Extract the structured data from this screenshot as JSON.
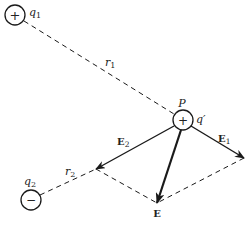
{
  "diagram": {
    "charges": [
      {
        "id": "q1",
        "label": "q",
        "subscript": "1",
        "sign": "+",
        "cx": 15,
        "cy": 15,
        "r": 10
      },
      {
        "id": "q2",
        "label": "q",
        "subscript": "2",
        "sign": "−",
        "cx": 31,
        "cy": 200,
        "r": 10
      }
    ],
    "test_charge": {
      "point_label": "P",
      "charge_label": "q′",
      "sign": "+",
      "cx": 183,
      "cy": 120,
      "r": 10
    },
    "distances": [
      {
        "label": "r",
        "subscript": "1"
      },
      {
        "label": "r",
        "subscript": "2"
      }
    ],
    "vectors": [
      {
        "label": "E",
        "subscript": "1"
      },
      {
        "label": "E",
        "subscript": "2"
      },
      {
        "label": "E",
        "subscript": ""
      }
    ],
    "colors": {
      "stroke": "#1a1a1a",
      "background": "#ffffff"
    }
  }
}
